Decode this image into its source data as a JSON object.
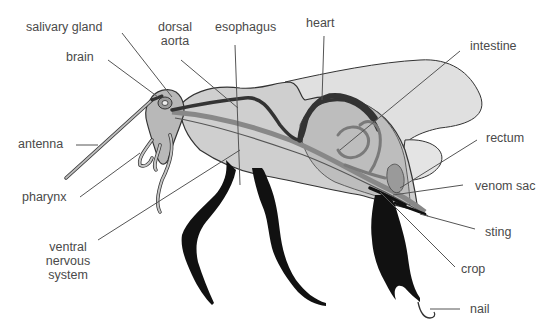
{
  "diagram": {
    "colors": {
      "body_fill": "#c8c8c8",
      "abdomen_light": "#dcdcdc",
      "organ_mid": "#9a9a9a",
      "organ_dark": "#3a3a3a",
      "legs": "#111111",
      "outline": "#333333",
      "label_text": "#4a4a4a",
      "leader_line": "#555555"
    },
    "labels": [
      {
        "id": "salivary-gland",
        "text": "salivary gland"
      },
      {
        "id": "brain",
        "text": "brain"
      },
      {
        "id": "dorsal-aorta",
        "text": "dorsal aorta",
        "lines": [
          "dorsal",
          "aorta"
        ]
      },
      {
        "id": "esophagus",
        "text": "esophagus"
      },
      {
        "id": "heart",
        "text": "heart"
      },
      {
        "id": "intestine",
        "text": "intestine"
      },
      {
        "id": "antenna",
        "text": "antenna"
      },
      {
        "id": "rectum",
        "text": "rectum"
      },
      {
        "id": "pharynx",
        "text": "pharynx"
      },
      {
        "id": "venom-sac",
        "text": "venom sac"
      },
      {
        "id": "ventral-nervous-system",
        "text": "ventral nervous system",
        "lines": [
          "ventral",
          "nervous",
          "system"
        ]
      },
      {
        "id": "sting",
        "text": "sting"
      },
      {
        "id": "crop",
        "text": "crop"
      },
      {
        "id": "nail",
        "text": "nail"
      }
    ]
  }
}
